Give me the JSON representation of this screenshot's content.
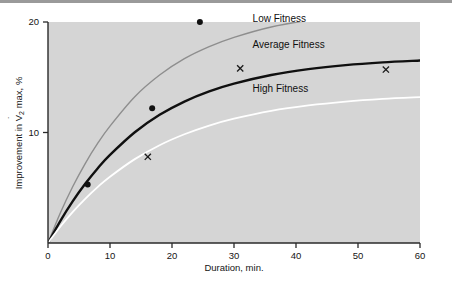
{
  "chart_data": {
    "type": "line",
    "title": "",
    "xlabel": "Duration, min.",
    "ylabel": "Improvement in V̇O₂ max, %",
    "ylabel_parts": {
      "lead": "Improvement in V",
      "dot": "˙",
      "v": "V",
      "sub": "2",
      "tail": " max, %"
    },
    "xlim": [
      0,
      60
    ],
    "ylim": [
      0,
      20
    ],
    "xticks": [
      0,
      10,
      20,
      30,
      40,
      50,
      60
    ],
    "xtick_labels": [
      "0",
      "10",
      "20",
      "30",
      "40",
      "50",
      "60"
    ],
    "yticks": [
      10,
      20
    ],
    "ytick_labels": [
      "10",
      "20"
    ],
    "grid": false,
    "legend_position": "inline-right",
    "plot_background": "#d5d5d5",
    "series": [
      {
        "name": "Low Fitness",
        "color": "#8e8e8e",
        "width": 1.4,
        "plateau": 21.6,
        "rate": 0.068,
        "label_x": 33,
        "label_y": 19.6,
        "points": [
          {
            "x": 0,
            "y": 0.0
          },
          {
            "x": 2,
            "y": 2.73
          },
          {
            "x": 4,
            "y": 5.11
          },
          {
            "x": 6,
            "y": 7.19
          },
          {
            "x": 8,
            "y": 9.01
          },
          {
            "x": 10,
            "y": 10.58
          },
          {
            "x": 14,
            "y": 13.24
          },
          {
            "x": 18,
            "y": 15.2
          },
          {
            "x": 22,
            "y": 16.68
          },
          {
            "x": 26,
            "y": 17.77
          },
          {
            "x": 30,
            "y": 18.61
          },
          {
            "x": 36,
            "y": 19.55
          },
          {
            "x": 42,
            "y": 20.15
          },
          {
            "x": 48,
            "y": 20.55
          },
          {
            "x": 54,
            "y": 20.82
          },
          {
            "x": 60,
            "y": 21.0
          }
        ]
      },
      {
        "name": "Average Fitness",
        "color": "#101010",
        "width": 2.4,
        "plateau": 17.3,
        "rate": 0.062,
        "label_x": 33,
        "label_y": 17.3,
        "points": [
          {
            "x": 0,
            "y": 0.0
          },
          {
            "x": 2,
            "y": 2.01
          },
          {
            "x": 4,
            "y": 3.79
          },
          {
            "x": 6,
            "y": 5.36
          },
          {
            "x": 8,
            "y": 6.75
          },
          {
            "x": 10,
            "y": 7.97
          },
          {
            "x": 14,
            "y": 10.02
          },
          {
            "x": 18,
            "y": 11.6
          },
          {
            "x": 22,
            "y": 12.8
          },
          {
            "x": 26,
            "y": 13.72
          },
          {
            "x": 30,
            "y": 14.42
          },
          {
            "x": 36,
            "y": 15.2
          },
          {
            "x": 42,
            "y": 15.73
          },
          {
            "x": 48,
            "y": 16.1
          },
          {
            "x": 54,
            "y": 16.35
          },
          {
            "x": 60,
            "y": 16.52
          }
        ]
      },
      {
        "name": "High Fitness",
        "color": "#ffffff",
        "width": 1.8,
        "plateau": 13.6,
        "rate": 0.058,
        "label_x": 33,
        "label_y": 13.3,
        "points": [
          {
            "x": 0,
            "y": 0.0
          },
          {
            "x": 2,
            "y": 1.49
          },
          {
            "x": 4,
            "y": 2.82
          },
          {
            "x": 6,
            "y": 4.0
          },
          {
            "x": 8,
            "y": 5.06
          },
          {
            "x": 10,
            "y": 6.0
          },
          {
            "x": 14,
            "y": 7.59
          },
          {
            "x": 18,
            "y": 8.85
          },
          {
            "x": 22,
            "y": 9.84
          },
          {
            "x": 26,
            "y": 10.63
          },
          {
            "x": 30,
            "y": 11.25
          },
          {
            "x": 36,
            "y": 11.96
          },
          {
            "x": 42,
            "y": 12.45
          },
          {
            "x": 48,
            "y": 12.8
          },
          {
            "x": 54,
            "y": 13.04
          },
          {
            "x": 60,
            "y": 13.2
          }
        ]
      }
    ],
    "scatter": [
      {
        "name": "filled-circle-data",
        "marker": "circle",
        "color": "#111111",
        "points": [
          {
            "x": 6.4,
            "y": 5.3
          },
          {
            "x": 16.8,
            "y": 12.2
          },
          {
            "x": 24.5,
            "y": 20.0
          }
        ]
      },
      {
        "name": "cross-data",
        "marker": "x",
        "color": "#1a1a1a",
        "points": [
          {
            "x": 16.1,
            "y": 7.8
          },
          {
            "x": 31.0,
            "y": 15.8
          },
          {
            "x": 54.5,
            "y": 15.7
          }
        ]
      }
    ]
  }
}
